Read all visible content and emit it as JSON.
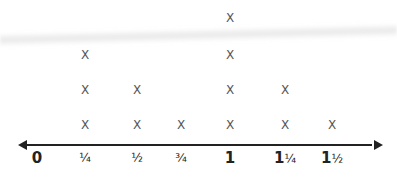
{
  "chart_data": {
    "type": "line_plot_dot",
    "title": "",
    "xlabel": "",
    "ylabel": "",
    "marker": "X",
    "categories": [
      "0",
      "1/4",
      "1/2",
      "3/4",
      "1",
      "1 1/4",
      "1 1/2"
    ],
    "tick_labels": [
      {
        "whole": "0",
        "frac": ""
      },
      {
        "whole": "",
        "frac": "¼"
      },
      {
        "whole": "",
        "frac": "½"
      },
      {
        "whole": "",
        "frac": "¾"
      },
      {
        "whole": "1",
        "frac": ""
      },
      {
        "whole": "1",
        "frac": "¼"
      },
      {
        "whole": "1",
        "frac": "½"
      }
    ],
    "values": [
      0,
      3,
      2,
      1,
      4,
      2,
      1
    ],
    "xlim": [
      0,
      1.5
    ],
    "grid": false,
    "axis_arrows": "both"
  },
  "colors": {
    "axis": "#222222",
    "marker": "#555555",
    "background": "#ffffff"
  }
}
